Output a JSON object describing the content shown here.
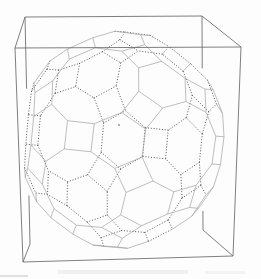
{
  "canvas": {
    "width": 261,
    "height": 279,
    "background": "#fdfdfd"
  },
  "box": {
    "corners": {
      "luf": [
        15,
        48
      ],
      "lub": [
        25,
        17
      ],
      "rub": [
        202,
        16
      ],
      "ruf": [
        241,
        47
      ],
      "ldf": [
        23,
        262
      ],
      "ldb": [
        30,
        244
      ],
      "rdb": [
        203,
        230
      ],
      "rdf": [
        233,
        256
      ]
    },
    "edges": [
      "luf-lub",
      "lub-rub",
      "rub-ruf",
      "ruf-luf",
      "luf-ldf",
      "lub-ldb",
      "rub-rdb",
      "ruf-rdf",
      "ldf-ldb",
      "rdb-rdf",
      "ldf-rdf"
    ],
    "occluded_edges": [
      "lub-rub",
      "lub-ldb",
      "rub-rdb"
    ],
    "stroke": "#686868",
    "stroke_width": 0.85
  },
  "polyhedron": {
    "name": "truncated icosidodecahedron wireframe",
    "orientation_deg": {
      "spin": 15,
      "tilt_x": -7,
      "tilt_y": -5
    },
    "visible_edge": {
      "stroke": "#a2a2a2",
      "width": 0.7
    },
    "hidden_edge": {
      "stroke": "#4e4e4e",
      "width": 1.0,
      "dash": "0.3 2.5",
      "opacity": 0.9
    },
    "visibility_threshold": -0.07,
    "center_marker": {
      "x": 119,
      "y": 125,
      "r": 0.9,
      "color": "#8c8c8c"
    }
  },
  "artifacts": [
    {
      "x": 0,
      "y": 275,
      "w": 28,
      "h": 2,
      "color": "#d8d8d8",
      "opacity": 0.8
    },
    {
      "x": 58,
      "y": 270,
      "w": 130,
      "h": 4,
      "color": "#f0f0f0",
      "opacity": 0.9
    },
    {
      "x": 205,
      "y": 271,
      "w": 40,
      "h": 3,
      "color": "#f2f2f2",
      "opacity": 0.9
    }
  ]
}
